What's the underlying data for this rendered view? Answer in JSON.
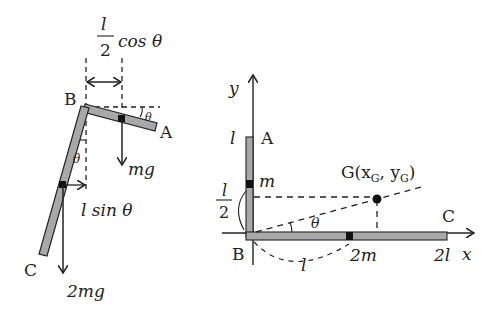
{
  "left_figure": {
    "point_B": "B",
    "point_A": "A",
    "point_C": "C",
    "theta_top": "θ",
    "theta_side": "θ",
    "dim_top_num": "l",
    "dim_top_den": "2",
    "dim_top_func": "cos θ",
    "force_small": "mg",
    "force_large": "2mg",
    "dim_side": "l sin θ"
  },
  "right_figure": {
    "y_axis": "y",
    "x_axis": "x",
    "tick_l": "l",
    "point_A": "A",
    "point_B": "B",
    "point_C": "C",
    "mass_m": "m",
    "mass_2m": "2m",
    "frac_num": "l",
    "frac_den": "2",
    "theta": "θ",
    "arc_l": "l",
    "tick_2l": "2l",
    "G_label": "G(x",
    "G_sub1": "G",
    "G_mid": ", y",
    "G_sub2": "G",
    "G_close": ")"
  },
  "colors": {
    "rod_fill": "#a8a8a8",
    "ink": "#222222"
  }
}
